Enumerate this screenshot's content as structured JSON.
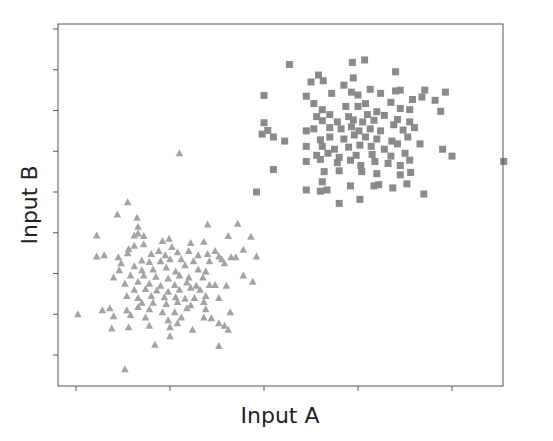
{
  "chart_data": {
    "type": "scatter",
    "title": "",
    "xlabel": "Input A",
    "ylabel": "Input B",
    "x_ticks": [
      0,
      1,
      2,
      3,
      4
    ],
    "y_ticks": [
      0,
      1,
      2,
      3,
      4,
      5,
      6,
      7,
      8
    ],
    "x_tick_labels": [],
    "y_tick_labels": [],
    "xlim": [
      -0.19,
      4.53
    ],
    "ylim": [
      -0.76,
      8.12
    ],
    "grid": false,
    "legend": null,
    "series": [
      {
        "name": "cluster-squares",
        "marker": "square",
        "color": "#8a8a8a",
        "points": [
          [
            2.27,
            7.13
          ],
          [
            2.94,
            7.18
          ],
          [
            3.07,
            7.24
          ],
          [
            3.4,
            6.95
          ],
          [
            2.58,
            6.87
          ],
          [
            2.95,
            6.8
          ],
          [
            2.85,
            6.62
          ],
          [
            2.5,
            6.7
          ],
          [
            2.63,
            6.73
          ],
          [
            3.13,
            6.52
          ],
          [
            3.4,
            6.48
          ],
          [
            3.45,
            6.5
          ],
          [
            3.71,
            6.5
          ],
          [
            3.68,
            6.33
          ],
          [
            2.0,
            6.37
          ],
          [
            2.45,
            6.35
          ],
          [
            2.72,
            6.42
          ],
          [
            2.93,
            6.45
          ],
          [
            3.0,
            6.38
          ],
          [
            3.24,
            6.42
          ],
          [
            3.58,
            6.27
          ],
          [
            3.82,
            6.25
          ],
          [
            3.93,
            6.45
          ],
          [
            2.53,
            6.17
          ],
          [
            3.08,
            6.17
          ],
          [
            3.35,
            6.2
          ],
          [
            2.62,
            6.02
          ],
          [
            2.87,
            6.1
          ],
          [
            3.0,
            6.1
          ],
          [
            3.2,
            5.97
          ],
          [
            3.45,
            6.05
          ],
          [
            3.55,
            6.02
          ],
          [
            3.88,
            5.98
          ],
          [
            2.56,
            5.85
          ],
          [
            2.7,
            5.9
          ],
          [
            2.9,
            5.85
          ],
          [
            3.1,
            5.9
          ],
          [
            3.28,
            5.88
          ],
          [
            3.42,
            5.78
          ],
          [
            2.0,
            5.7
          ],
          [
            2.62,
            5.75
          ],
          [
            2.78,
            5.72
          ],
          [
            2.95,
            5.77
          ],
          [
            3.05,
            5.72
          ],
          [
            3.17,
            5.76
          ],
          [
            3.38,
            5.65
          ],
          [
            3.55,
            5.72
          ],
          [
            2.04,
            5.51
          ],
          [
            2.45,
            5.5
          ],
          [
            2.53,
            5.55
          ],
          [
            2.7,
            5.58
          ],
          [
            2.82,
            5.55
          ],
          [
            2.93,
            5.6
          ],
          [
            3.01,
            5.5
          ],
          [
            3.13,
            5.55
          ],
          [
            3.24,
            5.5
          ],
          [
            3.48,
            5.52
          ],
          [
            3.6,
            5.58
          ],
          [
            1.98,
            5.42
          ],
          [
            2.1,
            5.35
          ],
          [
            2.22,
            5.25
          ],
          [
            2.6,
            5.28
          ],
          [
            2.7,
            5.35
          ],
          [
            2.85,
            5.3
          ],
          [
            2.96,
            5.4
          ],
          [
            3.08,
            5.35
          ],
          [
            3.2,
            5.3
          ],
          [
            3.36,
            5.25
          ],
          [
            3.53,
            5.35
          ],
          [
            2.45,
            5.12
          ],
          [
            2.62,
            5.12
          ],
          [
            2.75,
            5.05
          ],
          [
            2.9,
            5.1
          ],
          [
            3.02,
            5.15
          ],
          [
            3.14,
            5.12
          ],
          [
            3.28,
            5.05
          ],
          [
            3.42,
            5.18
          ],
          [
            3.66,
            5.18
          ],
          [
            3.9,
            5.05
          ],
          [
            2.56,
            4.9
          ],
          [
            2.68,
            4.95
          ],
          [
            2.8,
            4.85
          ],
          [
            2.98,
            4.9
          ],
          [
            3.15,
            4.92
          ],
          [
            3.35,
            4.88
          ],
          [
            3.5,
            4.95
          ],
          [
            4.0,
            4.88
          ],
          [
            4.55,
            4.75
          ],
          [
            2.45,
            4.75
          ],
          [
            2.6,
            4.8
          ],
          [
            2.78,
            4.72
          ],
          [
            2.92,
            4.78
          ],
          [
            3.03,
            4.65
          ],
          [
            3.18,
            4.75
          ],
          [
            3.32,
            4.7
          ],
          [
            3.45,
            4.65
          ],
          [
            3.55,
            4.78
          ],
          [
            2.1,
            4.55
          ],
          [
            2.64,
            4.5
          ],
          [
            2.8,
            4.52
          ],
          [
            3.04,
            4.5
          ],
          [
            3.2,
            4.45
          ],
          [
            3.45,
            4.42
          ],
          [
            3.56,
            4.48
          ],
          [
            2.62,
            4.25
          ],
          [
            3.17,
            4.15
          ],
          [
            3.37,
            4.1
          ],
          [
            3.52,
            4.2
          ],
          [
            2.45,
            4.05
          ],
          [
            2.6,
            4.02
          ],
          [
            2.67,
            4.05
          ],
          [
            2.92,
            4.15
          ],
          [
            3.22,
            4.18
          ],
          [
            3.7,
            3.95
          ],
          [
            1.92,
            4.0
          ],
          [
            2.8,
            3.72
          ],
          [
            3.02,
            3.82
          ]
        ]
      },
      {
        "name": "cluster-triangles",
        "marker": "triangle",
        "color": "#a3a3a3",
        "points": [
          [
            1.1,
            4.95
          ],
          [
            0.55,
            3.75
          ],
          [
            0.44,
            3.45
          ],
          [
            0.65,
            3.37
          ],
          [
            0.66,
            3.15
          ],
          [
            1.4,
            3.2
          ],
          [
            1.72,
            3.22
          ],
          [
            0.22,
            2.93
          ],
          [
            0.62,
            2.93
          ],
          [
            0.66,
            2.98
          ],
          [
            0.72,
            2.92
          ],
          [
            0.92,
            2.8
          ],
          [
            0.99,
            2.85
          ],
          [
            1.22,
            2.75
          ],
          [
            1.36,
            2.78
          ],
          [
            1.62,
            2.92
          ],
          [
            1.86,
            2.9
          ],
          [
            1.78,
            2.58
          ],
          [
            0.56,
            2.6
          ],
          [
            0.62,
            2.68
          ],
          [
            0.72,
            2.72
          ],
          [
            0.88,
            2.55
          ],
          [
            1.02,
            2.65
          ],
          [
            1.2,
            2.55
          ],
          [
            1.4,
            2.48
          ],
          [
            1.48,
            2.55
          ],
          [
            1.65,
            2.4
          ],
          [
            0.22,
            2.42
          ],
          [
            0.3,
            2.45
          ],
          [
            0.45,
            2.4
          ],
          [
            0.55,
            2.5
          ],
          [
            0.8,
            2.48
          ],
          [
            0.95,
            2.45
          ],
          [
            1.08,
            2.52
          ],
          [
            1.3,
            2.45
          ],
          [
            1.52,
            2.42
          ],
          [
            1.7,
            2.4
          ],
          [
            1.92,
            2.42
          ],
          [
            0.48,
            2.25
          ],
          [
            0.7,
            2.32
          ],
          [
            0.78,
            2.28
          ],
          [
            0.9,
            2.3
          ],
          [
            1.0,
            2.35
          ],
          [
            1.12,
            2.35
          ],
          [
            1.25,
            2.3
          ],
          [
            1.42,
            2.3
          ],
          [
            1.55,
            2.35
          ],
          [
            0.46,
            2.08
          ],
          [
            0.62,
            2.18
          ],
          [
            0.7,
            2.08
          ],
          [
            0.82,
            2.1
          ],
          [
            0.96,
            2.15
          ],
          [
            1.06,
            2.05
          ],
          [
            1.16,
            2.2
          ],
          [
            1.3,
            2.1
          ],
          [
            1.58,
            2.25
          ],
          [
            0.4,
            1.9
          ],
          [
            0.58,
            1.95
          ],
          [
            0.72,
            1.95
          ],
          [
            0.85,
            1.92
          ],
          [
            0.98,
            1.88
          ],
          [
            1.1,
            1.95
          ],
          [
            1.2,
            1.9
          ],
          [
            1.35,
            1.9
          ],
          [
            1.38,
            2.05
          ],
          [
            1.78,
            1.95
          ],
          [
            1.88,
            1.8
          ],
          [
            0.52,
            1.75
          ],
          [
            0.66,
            1.8
          ],
          [
            0.78,
            1.75
          ],
          [
            0.9,
            1.7
          ],
          [
            1.05,
            1.72
          ],
          [
            1.18,
            1.78
          ],
          [
            1.28,
            1.7
          ],
          [
            1.42,
            1.72
          ],
          [
            1.6,
            1.7
          ],
          [
            0.62,
            1.6
          ],
          [
            0.74,
            1.62
          ],
          [
            0.86,
            1.58
          ],
          [
            0.98,
            1.55
          ],
          [
            1.1,
            1.6
          ],
          [
            1.22,
            1.65
          ],
          [
            1.32,
            1.6
          ],
          [
            1.48,
            1.72
          ],
          [
            0.54,
            1.45
          ],
          [
            0.66,
            1.4
          ],
          [
            0.8,
            1.45
          ],
          [
            0.94,
            1.42
          ],
          [
            1.06,
            1.42
          ],
          [
            1.16,
            1.38
          ],
          [
            1.26,
            1.4
          ],
          [
            1.38,
            1.45
          ],
          [
            1.52,
            1.4
          ],
          [
            0.7,
            1.28
          ],
          [
            0.82,
            1.28
          ],
          [
            0.96,
            1.25
          ],
          [
            1.08,
            1.3
          ],
          [
            1.22,
            1.22
          ],
          [
            1.36,
            1.3
          ],
          [
            0.28,
            1.1
          ],
          [
            0.36,
            1.15
          ],
          [
            0.54,
            1.1
          ],
          [
            0.66,
            1.18
          ],
          [
            0.78,
            1.12
          ],
          [
            0.92,
            1.05
          ],
          [
            1.05,
            1.05
          ],
          [
            1.18,
            1.15
          ],
          [
            1.38,
            1.12
          ],
          [
            1.64,
            1.05
          ],
          [
            0.4,
            0.95
          ],
          [
            0.58,
            0.98
          ],
          [
            0.74,
            0.92
          ],
          [
            0.98,
            0.85
          ],
          [
            1.12,
            0.92
          ],
          [
            1.36,
            0.92
          ],
          [
            1.44,
            0.9
          ],
          [
            0.02,
            1.0
          ],
          [
            0.38,
            0.65
          ],
          [
            0.56,
            0.68
          ],
          [
            0.78,
            0.72
          ],
          [
            1.0,
            0.68
          ],
          [
            1.08,
            0.78
          ],
          [
            1.24,
            0.62
          ],
          [
            1.52,
            0.78
          ],
          [
            1.58,
            0.72
          ],
          [
            1.62,
            0.62
          ],
          [
            1.0,
            0.46
          ],
          [
            0.84,
            0.25
          ],
          [
            1.52,
            0.22
          ],
          [
            0.52,
            -0.35
          ]
        ]
      }
    ]
  }
}
